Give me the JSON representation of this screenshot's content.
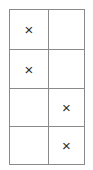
{
  "figure": {
    "kind": "grid-table",
    "columns": 2,
    "rows": 4,
    "border_color": "#8a8a8a",
    "background_color": "#ffffff",
    "mark_color": "#2e2e2e",
    "mark_glyph": "×"
  },
  "grid": {
    "cells": [
      [
        {
          "mark": "×",
          "filled": true
        },
        {
          "mark": "",
          "filled": false
        }
      ],
      [
        {
          "mark": "×",
          "filled": true
        },
        {
          "mark": "",
          "filled": false
        }
      ],
      [
        {
          "mark": "",
          "filled": false
        },
        {
          "mark": "×",
          "filled": true
        }
      ],
      [
        {
          "mark": "",
          "filled": false
        },
        {
          "mark": "×",
          "filled": true
        }
      ]
    ]
  }
}
